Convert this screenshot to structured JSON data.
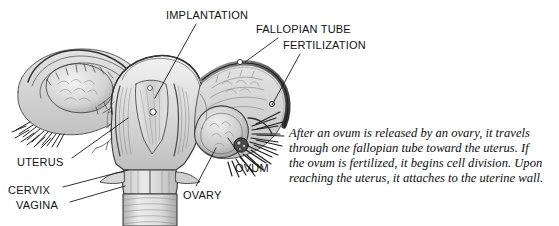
{
  "figure": {
    "kind": "anatomical-illustration",
    "style": "grayscale pencil drawing",
    "background_color": "#ffffff",
    "label_color": "#111111",
    "caption_color": "#0d0d0d"
  },
  "labels": [
    {
      "id": "implantation",
      "text": "IMPLANTATION",
      "x": 166,
      "y": 10,
      "anchor": "start"
    },
    {
      "id": "fallopian_tube",
      "text": "FALLOPIAN TUBE",
      "x": 256,
      "y": 24,
      "anchor": "start"
    },
    {
      "id": "fertilization",
      "text": "FERTILIZATION",
      "x": 283,
      "y": 40,
      "anchor": "start"
    },
    {
      "id": "uterus",
      "text": "UTERUS",
      "x": 17,
      "y": 157,
      "anchor": "start"
    },
    {
      "id": "cervix",
      "text": "CERVIX",
      "x": 8,
      "y": 185,
      "anchor": "start"
    },
    {
      "id": "vagina",
      "text": "VAGINA",
      "x": 16,
      "y": 200,
      "anchor": "start"
    },
    {
      "id": "ovum",
      "text": "OVUM",
      "x": 235,
      "y": 163,
      "anchor": "start"
    },
    {
      "id": "ovary",
      "text": "OVARY",
      "x": 183,
      "y": 190,
      "anchor": "start"
    }
  ],
  "leader_lines": [
    {
      "id": "implantation-leader",
      "from": [
        196,
        24
      ],
      "to": [
        155,
        98
      ]
    },
    {
      "id": "fallopian-tube-leader",
      "from": [
        278,
        38
      ],
      "to": [
        245,
        62
      ]
    },
    {
      "id": "fertilization-leader",
      "from": [
        300,
        54
      ],
      "to": [
        272,
        105
      ]
    },
    {
      "id": "uterus-leader",
      "from": [
        72,
        158
      ],
      "to": [
        128,
        118
      ]
    },
    {
      "id": "cervix-leader",
      "from": [
        63,
        187
      ],
      "to": [
        128,
        170
      ]
    },
    {
      "id": "vagina-leader",
      "from": [
        70,
        202
      ],
      "to": [
        125,
        186
      ]
    },
    {
      "id": "ovum-leader",
      "from": [
        243,
        160
      ],
      "to": [
        228,
        138
      ]
    },
    {
      "id": "ovary-leader",
      "from": [
        196,
        186
      ],
      "to": [
        216,
        148
      ]
    }
  ],
  "caption": {
    "lines": [
      "After an ovum is released by an ovary, it travels",
      "through one fallopian tube toward the uterus. If",
      "the ovum is fertilized, it begins cell division. Upon",
      "reaching the uterus, it attaches to the uterine wall."
    ]
  }
}
